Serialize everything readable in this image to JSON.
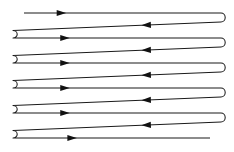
{
  "figure": {
    "background_color": "#ffffff",
    "stroke_color": "#1a1a1a",
    "arrow_color": "#111111",
    "width": 234,
    "height": 152,
    "stroke_width": 1.05,
    "pass_count": 11,
    "left_turns": 5,
    "right_turns": 5,
    "entry": "top-left open end",
    "exit": "bottom-right open end"
  },
  "geometry": {
    "left_x": 10,
    "right_x": 224,
    "left_turn_x": 13,
    "right_turn_x": 221,
    "entry_x": 24,
    "exit_x": 210
  },
  "passes": [
    {
      "index": 0,
      "direction": "right",
      "x1": 24,
      "y1": 13.0,
      "x2": 221,
      "y2": 13.0,
      "open_start": true,
      "open_end": false,
      "arrow_at": 0.19,
      "arrow_dir": "right"
    },
    {
      "index": 1,
      "direction": "left",
      "x1": 221,
      "y1": 22.0,
      "x2": 13,
      "y2": 30.5,
      "open_start": false,
      "open_end": false,
      "arrow_at": 0.36,
      "arrow_dir": "left"
    },
    {
      "index": 2,
      "direction": "right",
      "x1": 13,
      "y1": 38.0,
      "x2": 221,
      "y2": 38.0,
      "open_start": false,
      "open_end": false,
      "arrow_at": 0.25,
      "arrow_dir": "right"
    },
    {
      "index": 3,
      "direction": "left",
      "x1": 221,
      "y1": 47.0,
      "x2": 13,
      "y2": 55.5,
      "open_start": false,
      "open_end": false,
      "arrow_at": 0.36,
      "arrow_dir": "left"
    },
    {
      "index": 4,
      "direction": "right",
      "x1": 13,
      "y1": 63.0,
      "x2": 221,
      "y2": 63.0,
      "open_start": false,
      "open_end": false,
      "arrow_at": 0.25,
      "arrow_dir": "right"
    },
    {
      "index": 5,
      "direction": "left",
      "x1": 221,
      "y1": 72.0,
      "x2": 13,
      "y2": 80.5,
      "open_start": false,
      "open_end": false,
      "arrow_at": 0.36,
      "arrow_dir": "left"
    },
    {
      "index": 6,
      "direction": "right",
      "x1": 13,
      "y1": 88.0,
      "x2": 221,
      "y2": 88.0,
      "open_start": false,
      "open_end": false,
      "arrow_at": 0.25,
      "arrow_dir": "right"
    },
    {
      "index": 7,
      "direction": "left",
      "x1": 221,
      "y1": 97.0,
      "x2": 13,
      "y2": 105.5,
      "open_start": false,
      "open_end": false,
      "arrow_at": 0.36,
      "arrow_dir": "left"
    },
    {
      "index": 8,
      "direction": "right",
      "x1": 13,
      "y1": 113.0,
      "x2": 221,
      "y2": 113.0,
      "open_start": false,
      "open_end": false,
      "arrow_at": 0.25,
      "arrow_dir": "right"
    },
    {
      "index": 9,
      "direction": "left",
      "x1": 221,
      "y1": 122.0,
      "x2": 13,
      "y2": 130.5,
      "open_start": false,
      "open_end": false,
      "arrow_at": 0.36,
      "arrow_dir": "left"
    },
    {
      "index": 10,
      "direction": "right",
      "x1": 13,
      "y1": 138.0,
      "x2": 210,
      "y2": 138.0,
      "open_start": false,
      "open_end": true,
      "arrow_at": 0.3,
      "arrow_dir": "right"
    }
  ],
  "arrow": {
    "length": 9.5,
    "half_width": 3.1
  }
}
